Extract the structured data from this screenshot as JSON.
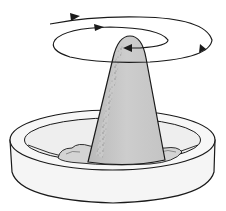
{
  "figure": {
    "caption_fragment": "",
    "colors": {
      "outline": "#1a1a1a",
      "cone_fill": "#c9c9c9",
      "speckle": "#8a8a8a",
      "dish_fill": "#f4f4f4",
      "dish_inner": "#ececec",
      "base_mound": "#d6d6d6",
      "background": "#ffffff"
    },
    "elements": [
      {
        "name": "spiral-arrows",
        "arrowheads": 4,
        "direction": "clockwise-inward"
      },
      {
        "name": "cone"
      },
      {
        "name": "dish"
      },
      {
        "name": "mound-at-base"
      }
    ]
  }
}
